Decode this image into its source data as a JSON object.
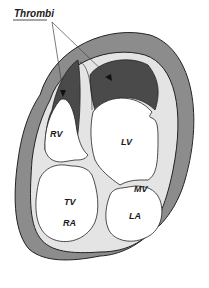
{
  "diagram": {
    "title": "Thrombi",
    "labels": {
      "rv": "RV",
      "lv": "LV",
      "tv": "TV",
      "mv": "MV",
      "ra": "RA",
      "la": "LA"
    },
    "colors": {
      "pericardium": "#8c8c8c",
      "myocardium": "#e4e4e4",
      "thrombus": "#4a4a4a",
      "chamber": "#ffffff",
      "outline": "#222222"
    }
  }
}
